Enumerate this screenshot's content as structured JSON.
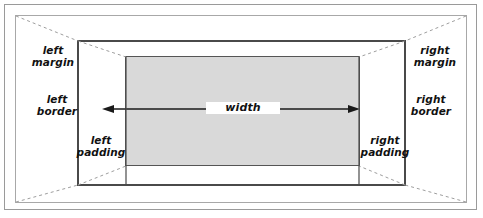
{
  "figure": {
    "type": "diagram",
    "width_px": 483,
    "height_px": 218,
    "background_color": "#ffffff"
  },
  "boxes": {
    "outer_frame": {
      "name": "containing-block-outer",
      "stroke": "#9a9a9a",
      "fill": "#ffffff"
    },
    "margin_box": {
      "name": "margin-edge",
      "stroke": "#a8a8a8",
      "fill": "#ffffff"
    },
    "border_box": {
      "name": "border-edge",
      "stroke": "#4a4a4a",
      "fill": "#ffffff"
    },
    "content_box": {
      "name": "content-area",
      "stroke": "#555555",
      "fill": "#d9d9d9"
    }
  },
  "labels": {
    "left_margin": "left\nmargin",
    "left_border": "left\nborder",
    "left_padding": "left\npadding",
    "right_margin": "right\nmargin",
    "right_border": "right\nborder",
    "right_padding": "right\npadding",
    "width": "width"
  },
  "annotations": {
    "width_arrow": {
      "name": "width-double-arrow",
      "direction": "double-headed-horizontal",
      "color": "#1a1a1a",
      "spans": "content box from left content edge to right content edge"
    },
    "diagonals": {
      "name": "perspective-dashed-lines",
      "color": "#9e9e9e",
      "style": "dashed",
      "count": 4,
      "description": "dashed lines joining the four corners of the margin edge to the four corners of the border edge"
    }
  }
}
